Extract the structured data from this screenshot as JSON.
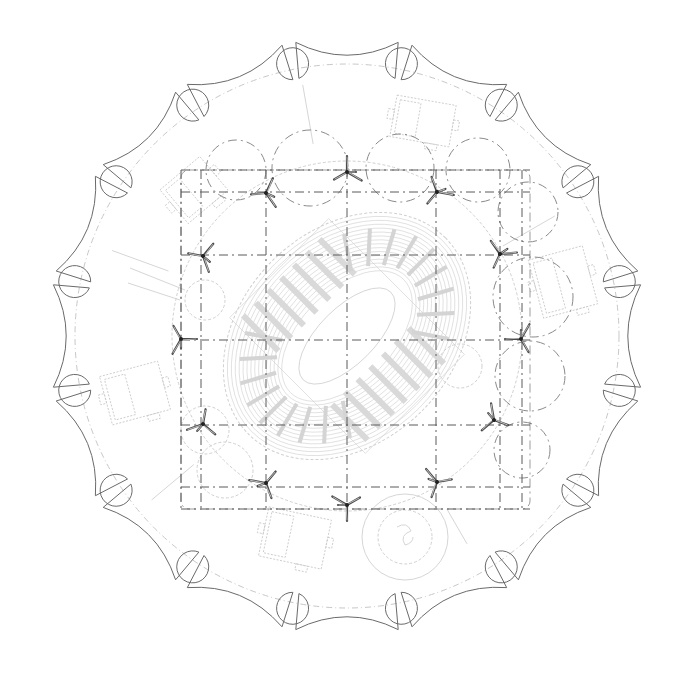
{
  "drawing": {
    "type": "architectural site plan",
    "subject": "circular stadium canopy with arena seating bowl",
    "width": 691,
    "height": 674,
    "center": [
      347,
      336
    ],
    "colors": {
      "background": "#ffffff",
      "outline": "#6a6a6a",
      "grid": "#5a5a5a",
      "faint": "#d6d6d6",
      "column": "#4a4a4a"
    }
  },
  "boundary": {
    "lobes": 16,
    "outer_radius": 298,
    "inner_radius": 262,
    "notch_radius": 16,
    "rotation_deg": 11.25
  },
  "site_ring": {
    "radius": 272
  },
  "grid": {
    "x_lines": [
      181,
      201,
      266,
      347,
      436,
      500,
      522
    ],
    "y_lines": [
      170,
      192,
      255,
      340,
      425,
      487,
      509
    ],
    "extent": {
      "x0": 181,
      "y0": 170,
      "x1": 530,
      "y1": 509
    }
  },
  "columns": [
    {
      "x": 347,
      "y": 172,
      "rot": 0
    },
    {
      "x": 266,
      "y": 193,
      "rot": 25
    },
    {
      "x": 437,
      "y": 192,
      "rot": -20
    },
    {
      "x": 203,
      "y": 256,
      "rot": 40
    },
    {
      "x": 500,
      "y": 254,
      "rot": -35
    },
    {
      "x": 181,
      "y": 339,
      "rot": 90
    },
    {
      "x": 521,
      "y": 339,
      "rot": -90
    },
    {
      "x": 203,
      "y": 424,
      "rot": 130
    },
    {
      "x": 494,
      "y": 420,
      "rot": -130
    },
    {
      "x": 266,
      "y": 483,
      "rot": 160
    },
    {
      "x": 437,
      "y": 482,
      "rot": -160
    },
    {
      "x": 347,
      "y": 505,
      "rot": 180
    }
  ],
  "bay_arcs": [
    {
      "cx": 236,
      "cy": 170,
      "r": 30
    },
    {
      "cx": 310,
      "cy": 168,
      "r": 38
    },
    {
      "cx": 400,
      "cy": 168,
      "r": 34
    },
    {
      "cx": 478,
      "cy": 170,
      "r": 32
    },
    {
      "cx": 528,
      "cy": 212,
      "r": 30
    },
    {
      "cx": 533,
      "cy": 297,
      "r": 40
    },
    {
      "cx": 530,
      "cy": 376,
      "r": 35
    },
    {
      "cx": 522,
      "cy": 450,
      "r": 28
    }
  ],
  "arena": {
    "center": [
      347,
      336
    ],
    "rotation_deg": -45,
    "outer_rx": 135,
    "outer_ry": 102,
    "inner_rx": 62,
    "inner_ry": 28,
    "rows": 14,
    "aisles": 26
  },
  "pads": [
    {
      "name": "pad-north",
      "x": 393,
      "y": 100,
      "w": 60,
      "h": 42,
      "rot": 10
    },
    {
      "name": "pad-northwest",
      "x": 168,
      "y": 168,
      "w": 52,
      "h": 44,
      "rot": -40
    },
    {
      "name": "pad-east",
      "x": 535,
      "y": 252,
      "w": 56,
      "h": 60,
      "rot": -15
    },
    {
      "name": "pad-west",
      "x": 105,
      "y": 368,
      "w": 60,
      "h": 50,
      "rot": -15
    },
    {
      "name": "pad-south",
      "x": 263,
      "y": 513,
      "w": 64,
      "h": 50,
      "rot": 12
    }
  ],
  "plaza_circle": {
    "cx": 405,
    "cy": 537,
    "r": 43,
    "inner_r": 27
  }
}
